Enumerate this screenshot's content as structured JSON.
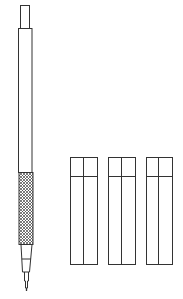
{
  "figure": {
    "title": "",
    "stroke_color": "#333333",
    "background": "#ffffff"
  },
  "objects": {
    "pencil": {
      "label": "",
      "parts": [
        "cap",
        "barrel",
        "knurled-grip",
        "cone",
        "tip-sleeve"
      ]
    },
    "containers": [
      {
        "label": ""
      },
      {
        "label": ""
      },
      {
        "label": ""
      }
    ]
  }
}
